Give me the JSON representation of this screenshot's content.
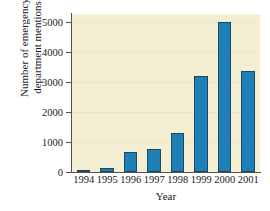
{
  "chart_data": {
    "type": "bar",
    "title": "",
    "xlabel": "Year",
    "ylabel_lines": [
      "Number of emergency",
      "department mentions"
    ],
    "ylabel": "Number of emergency department mentions",
    "categories": [
      "1994",
      "1995",
      "1996",
      "1997",
      "1998",
      "1999",
      "2000",
      "2001"
    ],
    "values": [
      50,
      150,
      650,
      750,
      1300,
      3200,
      4990,
      3350
    ],
    "ylim": [
      0,
      5250
    ],
    "yticks": [
      0,
      1000,
      2000,
      3000,
      4000,
      5000
    ],
    "ytick_labels": [
      "0",
      "1000",
      "2000",
      "3000",
      "4000",
      "5000"
    ],
    "grid": true,
    "legend": null,
    "colors": {
      "bar_fill": "#1d7fb6",
      "bar_edge": "#184b63",
      "plot_background": "#f4eed3",
      "gridline": "#ece5c4",
      "axis": "#555049",
      "text": "#1a1a1a",
      "figure_background": "#ffffff"
    }
  }
}
